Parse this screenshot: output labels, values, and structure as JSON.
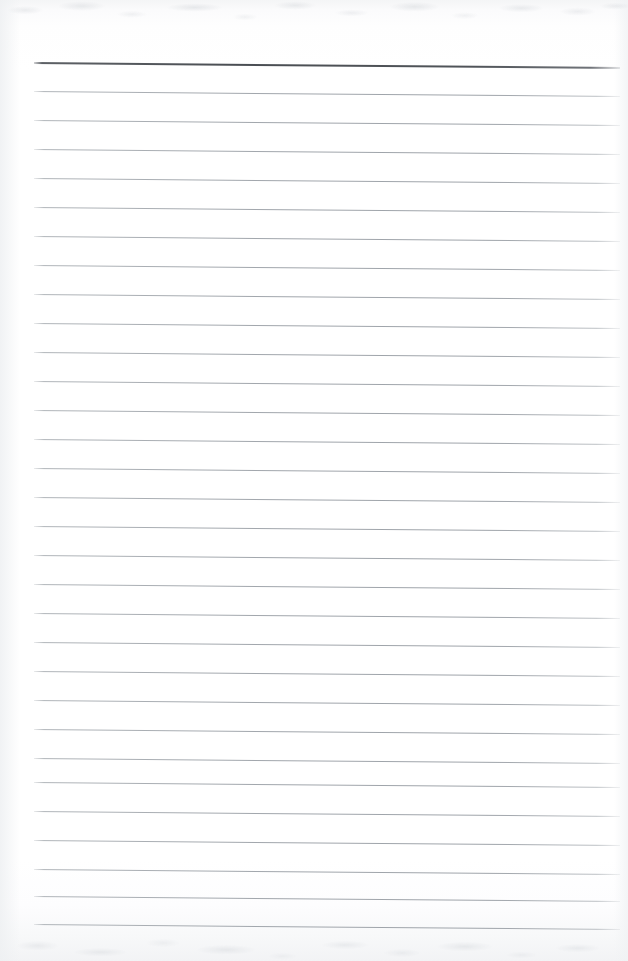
{
  "document": {
    "kind": "scanned-blank-ruled-paper",
    "page_label": "",
    "has_text_content": false,
    "written_content": "",
    "orientation": "portrait"
  },
  "sheet": {
    "width_px": 628,
    "height_px": 961,
    "paper_color": "#fdfdfe",
    "background_color": "#ffffff"
  },
  "ruling": {
    "line_count": 31,
    "first_line_y": 62,
    "line_spacing_px": 29,
    "line_start_x": 34,
    "line_end_x": 620,
    "tilt_px_over_width": 5,
    "regular_line_color": "#a0a5ab",
    "regular_line_thickness_px": 1,
    "header_line_color": "#4a4e53",
    "header_line_thickness_px": 2,
    "header_line_index": 0,
    "lines": [
      {
        "index": 0,
        "y": 62,
        "style": "header"
      },
      {
        "index": 1,
        "y": 91,
        "style": "regular"
      },
      {
        "index": 2,
        "y": 120,
        "style": "regular"
      },
      {
        "index": 3,
        "y": 149,
        "style": "regular"
      },
      {
        "index": 4,
        "y": 178,
        "style": "regular"
      },
      {
        "index": 5,
        "y": 207,
        "style": "regular"
      },
      {
        "index": 6,
        "y": 236,
        "style": "regular"
      },
      {
        "index": 7,
        "y": 265,
        "style": "regular"
      },
      {
        "index": 8,
        "y": 294,
        "style": "regular"
      },
      {
        "index": 9,
        "y": 323,
        "style": "regular"
      },
      {
        "index": 10,
        "y": 352,
        "style": "regular"
      },
      {
        "index": 11,
        "y": 381,
        "style": "regular"
      },
      {
        "index": 12,
        "y": 410,
        "style": "regular"
      },
      {
        "index": 13,
        "y": 439,
        "style": "regular"
      },
      {
        "index": 14,
        "y": 468,
        "style": "regular"
      },
      {
        "index": 15,
        "y": 497,
        "style": "regular"
      },
      {
        "index": 16,
        "y": 526,
        "style": "regular"
      },
      {
        "index": 17,
        "y": 555,
        "style": "regular"
      },
      {
        "index": 18,
        "y": 584,
        "style": "regular"
      },
      {
        "index": 19,
        "y": 613,
        "style": "regular"
      },
      {
        "index": 20,
        "y": 642,
        "style": "regular"
      },
      {
        "index": 21,
        "y": 671,
        "style": "regular"
      },
      {
        "index": 22,
        "y": 700,
        "style": "regular"
      },
      {
        "index": 23,
        "y": 729,
        "style": "regular"
      },
      {
        "index": 24,
        "y": 758,
        "style": "regular"
      },
      {
        "index": 25,
        "y": 782,
        "style": "regular"
      },
      {
        "index": 26,
        "y": 811,
        "style": "regular"
      },
      {
        "index": 27,
        "y": 840,
        "style": "regular"
      },
      {
        "index": 28,
        "y": 869,
        "style": "regular"
      },
      {
        "index": 29,
        "y": 896,
        "style": "regular"
      },
      {
        "index": 30,
        "y": 924,
        "style": "regular"
      }
    ]
  },
  "margins": {
    "left_px": 34,
    "right_px": 8,
    "top_px": 62,
    "bottom_px": 37
  }
}
